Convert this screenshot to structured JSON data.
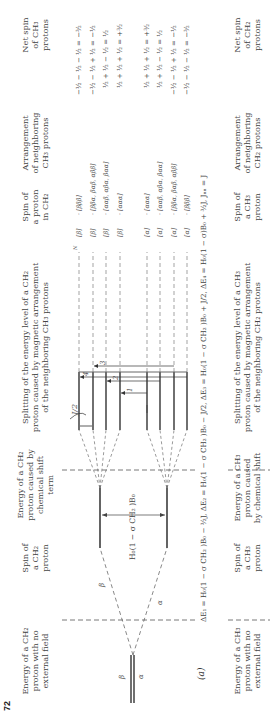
{
  "page_number": "72",
  "figure_label": "(a)",
  "top_table": {
    "headers": {
      "col1": [
        "Energy of a CH₂",
        "proton with no",
        "external field"
      ],
      "col2": [
        "Spin of",
        "a CH₂",
        "proton"
      ],
      "col3": [
        "Energy of a CH₂",
        "proton caused by",
        "chemical shift",
        "term"
      ],
      "col4": [
        "Splitting of the energy level of a CH₂",
        "proton caused by magnetic arrangement",
        "of the neighboring CH₃ protons"
      ],
      "col5": [
        "Spin of",
        "a proton",
        "in CH₂"
      ],
      "col6": [
        "Arrangement",
        "of neighboring",
        "CH₃ protons"
      ],
      "col7": [
        "Net spin",
        "of CH₃",
        "protons"
      ]
    },
    "diagram": {
      "zero_field_labels": {
        "upper": "β",
        "lower": "α"
      },
      "branch_labels": {
        "beta": "β",
        "alpha": "α"
      },
      "shift_label": "H₀(1 − σ CH₂ )B₀",
      "half_j_label": "J/2",
      "transition_numbers": [
        "1",
        "2",
        "3",
        "4"
      ],
      "n_marker": "N"
    },
    "rows": [
      {
        "proton_spin": "[β]",
        "arrangement": "[βββ]",
        "net_spin": "−½ − ½ − ½ = −³⁄₂"
      },
      {
        "proton_spin": "[β]",
        "arrangement": "[ββα, βαβ, αββ]",
        "net_spin": "−½ − ½ + ½ = −½"
      },
      {
        "proton_spin": "[β]",
        "arrangement": "[ααβ, αβα, βαα]",
        "net_spin": "½ + ½ − ½ = ½"
      },
      {
        "proton_spin": "[β]",
        "arrangement": "[ααα]",
        "net_spin": "½ + ½ + ½ = +³⁄₂"
      },
      {
        "proton_spin": "[α]",
        "arrangement": "[ααα]",
        "net_spin": "½ + ½ + ½ = +³⁄₂"
      },
      {
        "proton_spin": "[α]",
        "arrangement": "[ααβ, αβα, βαα]",
        "net_spin": "½ + ½ − ½ = ½"
      },
      {
        "proton_spin": "[α]",
        "arrangement": "[ββα, βαβ, αββ]",
        "net_spin": "−½ − ½ + ½ = −½"
      },
      {
        "proton_spin": "[α]",
        "arrangement": "[βββ]",
        "net_spin": "−½ − ½ − ½ = −³⁄₂"
      }
    ],
    "equation": "ΔE₁ = H₀(1 − σ CH₂ )B₀ − ³⁄₂J, ΔE₂ = H₀(1 − σ CH₂ )B₀ − J/2, ΔE₃ = H₀(1 − σ CH₂ )B₀ + J/2, ΔE₄ = H₀(1 − σ)B₀ + ³⁄₂J,  Jₙₙ = J"
  },
  "bottom_table": {
    "headers": {
      "col1": [
        "Energy of a CH₃",
        "proton with no",
        "external field"
      ],
      "col2": [
        "Spin of",
        "a CH₃",
        "proton"
      ],
      "col3": [
        "Energy of a CH₃",
        "proton caused",
        "by chemical shift"
      ],
      "col4": [
        "Splitting of the energy level of a CH₃",
        "proton caused by magnetic arrangement",
        "of the neighboring CH₂ protons"
      ],
      "col5": [
        "Spin of",
        "a CH₃",
        "proton"
      ],
      "col6": [
        "Arrangement",
        "of neighboring",
        "CH₂ protons"
      ],
      "col7": [
        "Net spin",
        "of CH₂",
        "protons"
      ]
    }
  }
}
